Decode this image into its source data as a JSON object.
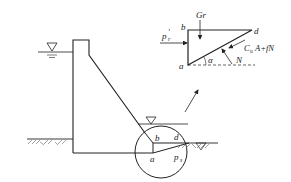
{
  "diagram": {
    "type": "gravity dam sliding stability sketch",
    "colors": {
      "stroke": "#222222",
      "background": "#ffffff"
    },
    "main": {
      "upstream_water_symbol": "water-level-triangle",
      "downstream_water_symbol": "water-level-triangle",
      "ground_symbol": "soil-hatching",
      "labels": {
        "b": "b",
        "d": "d",
        "a": "a",
        "p": "p",
        "p_sub": "s"
      }
    },
    "inset": {
      "labels": {
        "b": "b",
        "d": "d",
        "a": "a",
        "gr": "Gr",
        "p_prime": "p",
        "p_prime_mark": "′",
        "p_prime_sub": "r",
        "friction_force": "C",
        "friction_sub": "u",
        "friction_rest": "A+fN",
        "alpha": "α",
        "normal": "N"
      }
    }
  }
}
